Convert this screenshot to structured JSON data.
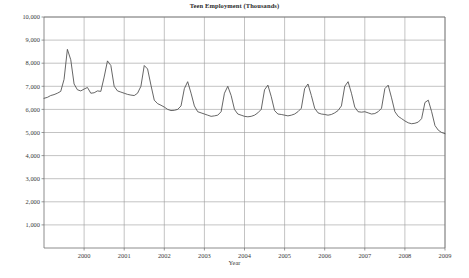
{
  "chart_data": {
    "type": "line",
    "title": "Teen Employment (Thousands)",
    "xlabel": "Year",
    "ylabel": "",
    "grid": true,
    "legend": "none",
    "xlim": [
      1999.0,
      2009.0
    ],
    "ylim": [
      0,
      10000
    ],
    "ytick_labels": [
      "10,000",
      "9,000",
      "8,000",
      "7,000",
      "6,000",
      "5,000",
      "4,000",
      "3,000",
      "2,000",
      "1,000"
    ],
    "ytick_values": [
      10000,
      9000,
      8000,
      7000,
      6000,
      5000,
      4000,
      3000,
      2000,
      1000
    ],
    "xtick_labels": [
      "2000",
      "2001",
      "2002",
      "2003",
      "2004",
      "2005",
      "2006",
      "2007",
      "2008",
      "2009"
    ],
    "xtick_values": [
      2000,
      2001,
      2002,
      2003,
      2004,
      2005,
      2006,
      2007,
      2008,
      2009
    ],
    "series": [
      {
        "name": "Teen Employment",
        "x": [
          1999.0,
          1999.083,
          1999.167,
          1999.25,
          1999.333,
          1999.417,
          1999.5,
          1999.583,
          1999.667,
          1999.75,
          1999.833,
          1999.917,
          2000.0,
          2000.083,
          2000.167,
          2000.25,
          2000.333,
          2000.417,
          2000.5,
          2000.583,
          2000.667,
          2000.75,
          2000.833,
          2000.917,
          2001.0,
          2001.083,
          2001.167,
          2001.25,
          2001.333,
          2001.417,
          2001.5,
          2001.583,
          2001.667,
          2001.75,
          2001.833,
          2001.917,
          2002.0,
          2002.083,
          2002.167,
          2002.25,
          2002.333,
          2002.417,
          2002.5,
          2002.583,
          2002.667,
          2002.75,
          2002.833,
          2002.917,
          2003.0,
          2003.083,
          2003.167,
          2003.25,
          2003.333,
          2003.417,
          2003.5,
          2003.583,
          2003.667,
          2003.75,
          2003.833,
          2003.917,
          2004.0,
          2004.083,
          2004.167,
          2004.25,
          2004.333,
          2004.417,
          2004.5,
          2004.583,
          2004.667,
          2004.75,
          2004.833,
          2004.917,
          2005.0,
          2005.083,
          2005.167,
          2005.25,
          2005.333,
          2005.417,
          2005.5,
          2005.583,
          2005.667,
          2005.75,
          2005.833,
          2005.917,
          2006.0,
          2006.083,
          2006.167,
          2006.25,
          2006.333,
          2006.417,
          2006.5,
          2006.583,
          2006.667,
          2006.75,
          2006.833,
          2006.917,
          2007.0,
          2007.083,
          2007.167,
          2007.25,
          2007.333,
          2007.417,
          2007.5,
          2007.583,
          2007.667,
          2007.75,
          2007.833,
          2007.917,
          2008.0,
          2008.083,
          2008.167,
          2008.25,
          2008.333,
          2008.417,
          2008.5,
          2008.583,
          2008.667,
          2008.75,
          2008.833,
          2008.917,
          2009.0
        ],
        "values": [
          6480,
          6520,
          6600,
          6640,
          6700,
          6780,
          7300,
          8600,
          8150,
          7100,
          6850,
          6800,
          6880,
          6950,
          6700,
          6720,
          6800,
          6780,
          7400,
          8100,
          7900,
          7000,
          6800,
          6750,
          6700,
          6650,
          6620,
          6600,
          6700,
          7000,
          7900,
          7750,
          7050,
          6400,
          6250,
          6180,
          6100,
          6000,
          5950,
          5960,
          6000,
          6150,
          6900,
          7200,
          6700,
          6150,
          5900,
          5850,
          5800,
          5750,
          5700,
          5720,
          5750,
          5900,
          6700,
          7000,
          6600,
          6000,
          5800,
          5750,
          5700,
          5680,
          5700,
          5750,
          5850,
          6000,
          6850,
          7050,
          6550,
          5950,
          5800,
          5780,
          5750,
          5720,
          5750,
          5800,
          5900,
          6050,
          6900,
          7100,
          6600,
          6050,
          5850,
          5800,
          5780,
          5750,
          5780,
          5850,
          5950,
          6150,
          7000,
          7200,
          6700,
          6100,
          5900,
          5880,
          5900,
          5850,
          5800,
          5820,
          5900,
          6050,
          6900,
          7050,
          6500,
          5900,
          5700,
          5600,
          5500,
          5420,
          5380,
          5400,
          5450,
          5600,
          6300,
          6400,
          5900,
          5300,
          5100,
          5000,
          4950
        ]
      }
    ]
  },
  "axes": {
    "plot_left": 44,
    "plot_right": 445,
    "plot_top": 17,
    "plot_bottom": 248
  }
}
